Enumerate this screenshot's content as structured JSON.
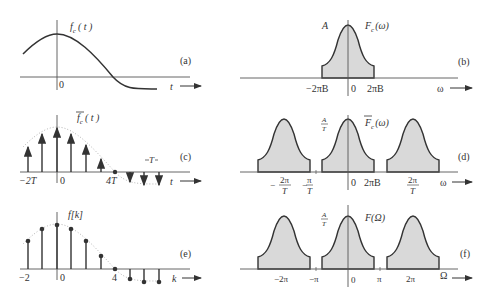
{
  "figure": {
    "panels": [
      {
        "id": "a",
        "label": "(a)",
        "title": "f_c(t)",
        "title_main": "f",
        "title_sub": "c",
        "title_arg": "( t )",
        "x_axis": "t",
        "ticks": [
          "0"
        ]
      },
      {
        "id": "b",
        "label": "(b)",
        "title": "F_c(ω)",
        "title_main": "F",
        "title_sub": "c",
        "title_arg": "(ω)",
        "amplitude": "A",
        "x_axis": "ω",
        "ticks": [
          "−2πB",
          "0",
          "2πB"
        ]
      },
      {
        "id": "c",
        "label": "(c)",
        "title": "f̄_c(t)",
        "title_main": "f",
        "title_sub": "c",
        "title_arg": "( t )",
        "x_axis": "t",
        "ticks": [
          "−2T",
          "0",
          "4T"
        ],
        "spacing_label": "T"
      },
      {
        "id": "d",
        "label": "(d)",
        "title": "F̄_c(ω)",
        "title_main": "F",
        "title_sub": "c",
        "title_arg": "(ω)",
        "amplitude_num": "A",
        "amplitude_den": "T",
        "x_axis": "ω",
        "ticks": [
          {
            "prefix": "−",
            "num": "2π",
            "den": "T"
          },
          {
            "prefix": "−",
            "num": "π",
            "den": "T"
          },
          {
            "text": "0"
          },
          {
            "text": "2πB"
          },
          {
            "prefix": "",
            "num": "2π",
            "den": "T"
          }
        ]
      },
      {
        "id": "e",
        "label": "(e)",
        "title": "f[k]",
        "x_axis": "k",
        "ticks": [
          "−2",
          "0",
          "4"
        ]
      },
      {
        "id": "f",
        "label": "(f)",
        "title": "F(Ω)",
        "amplitude_num": "A",
        "amplitude_den": "T",
        "x_axis": "Ω",
        "ticks": [
          "−2π",
          "−π",
          "0",
          "π",
          "2π"
        ]
      }
    ],
    "samples": {
      "indices": [
        -2,
        -1,
        0,
        1,
        2,
        3,
        4,
        5,
        6,
        7
      ],
      "relative_heights": [
        0.55,
        0.78,
        0.92,
        0.78,
        0.55,
        0.28,
        0.0,
        -0.22,
        -0.33,
        -0.33
      ]
    }
  }
}
